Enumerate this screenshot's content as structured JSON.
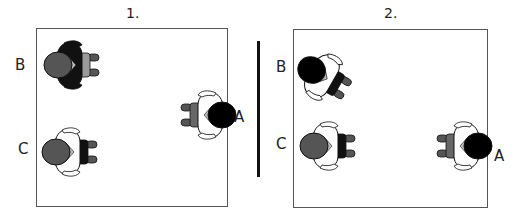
{
  "panels": [
    {
      "title": "1.",
      "people": [
        {
          "label": "B",
          "facing": "right",
          "head": "#555555",
          "shirt": "#111111",
          "pants": "#9a9a9a"
        },
        {
          "label": "A",
          "facing": "left",
          "head": "#000000",
          "shirt": "#ffffff",
          "pants": "#666666"
        },
        {
          "label": "C",
          "facing": "right",
          "head": "#555555",
          "shirt": "#ffffff",
          "pants": "#111111"
        }
      ]
    },
    {
      "title": "2.",
      "people": [
        {
          "label": "B",
          "facing": "down-right",
          "head": "#000000",
          "shirt": "#ffffff",
          "pants": "#111111"
        },
        {
          "label": "C",
          "facing": "right",
          "head": "#555555",
          "shirt": "#ffffff",
          "pants": "#111111"
        },
        {
          "label": "A",
          "facing": "left",
          "head": "#000000",
          "shirt": "#ffffff",
          "pants": "#666666"
        }
      ]
    }
  ],
  "icons": {
    "person": "person-top-view-icon"
  }
}
